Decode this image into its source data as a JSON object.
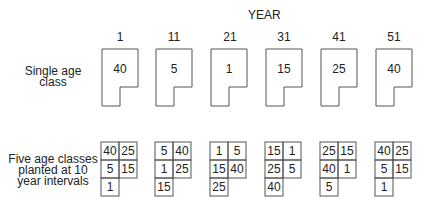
{
  "header": {
    "title": "YEAR"
  },
  "years": [
    "1",
    "11",
    "21",
    "31",
    "41",
    "51"
  ],
  "rows": {
    "single": {
      "label_lines": [
        "Single age",
        "class"
      ]
    },
    "five": {
      "label_lines": [
        "Five age classes",
        "planted at 10",
        "year intervals"
      ]
    }
  },
  "single_values": [
    "40",
    "5",
    "1",
    "15",
    "25",
    "40"
  ],
  "five_grids": [
    [
      "40",
      "25",
      "5",
      "15",
      "1"
    ],
    [
      "5",
      "40",
      "1",
      "25",
      "15"
    ],
    [
      "1",
      "5",
      "15",
      "40",
      "25"
    ],
    [
      "15",
      "1",
      "25",
      "5",
      "40"
    ],
    [
      "25",
      "15",
      "40",
      "1",
      "5"
    ],
    [
      "40",
      "25",
      "5",
      "15",
      "1"
    ]
  ],
  "colors": {
    "stroke": "#555555",
    "text": "#222222"
  }
}
